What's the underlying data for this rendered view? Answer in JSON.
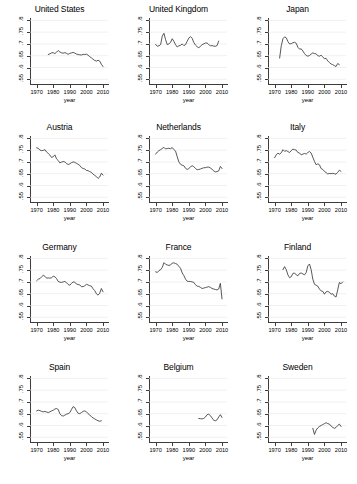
{
  "figure": {
    "layout": "4 rows x 3 columns small multiples",
    "background_color": "#ffffff",
    "line_color": "#3a3a3a",
    "gridline_color": "#e6e6e6",
    "axis_color": "#3c3c3c"
  },
  "axes": {
    "xlabel": "year",
    "ylabel": "",
    "xticks": [
      "1970",
      "1980",
      "1990",
      "2000",
      "2010"
    ],
    "xtick_values": [
      1970,
      1980,
      1990,
      2000,
      2010
    ],
    "yticks": [
      ".55",
      ".6",
      ".65",
      ".7",
      ".75",
      ".8"
    ],
    "ytick_values": [
      0.55,
      0.6,
      0.65,
      0.7,
      0.75,
      0.8
    ],
    "xlim": [
      1966,
      2013
    ],
    "ylim": [
      0.53,
      0.81
    ],
    "grid": "horizontal"
  },
  "chart_data": {
    "type": "line",
    "title": "",
    "xlabel": "year",
    "ylabel": "",
    "xlim": [
      1966,
      2013
    ],
    "ylim": [
      0.53,
      0.81
    ],
    "grid": true,
    "legend": "none",
    "panels": [
      {
        "title": "United States",
        "x": [
          1977,
          1978,
          1979,
          1980,
          1981,
          1982,
          1983,
          1984,
          1985,
          1986,
          1987,
          1988,
          1989,
          1990,
          1991,
          1992,
          1993,
          1994,
          1995,
          1996,
          1997,
          1998,
          1999,
          2000,
          2001,
          2002,
          2003,
          2004,
          2005,
          2006,
          2007,
          2008,
          2009,
          2010
        ],
        "values": [
          0.655,
          0.658,
          0.662,
          0.663,
          0.659,
          0.665,
          0.672,
          0.666,
          0.662,
          0.661,
          0.663,
          0.66,
          0.656,
          0.66,
          0.662,
          0.664,
          0.661,
          0.657,
          0.655,
          0.654,
          0.653,
          0.656,
          0.655,
          0.657,
          0.652,
          0.646,
          0.641,
          0.635,
          0.63,
          0.627,
          0.631,
          0.627,
          0.614,
          0.604
        ]
      },
      {
        "title": "United Kingdom",
        "x": [
          1970,
          1971,
          1972,
          1973,
          1974,
          1975,
          1976,
          1977,
          1978,
          1979,
          1980,
          1981,
          1982,
          1983,
          1984,
          1985,
          1986,
          1987,
          1988,
          1989,
          1990,
          1991,
          1992,
          1993,
          1994,
          1995,
          1996,
          1997,
          1998,
          1999,
          2000,
          2001,
          2002,
          2003,
          2004,
          2005,
          2006,
          2007,
          2008
        ],
        "values": [
          0.698,
          0.69,
          0.692,
          0.697,
          0.733,
          0.745,
          0.718,
          0.697,
          0.7,
          0.707,
          0.722,
          0.711,
          0.697,
          0.687,
          0.692,
          0.694,
          0.7,
          0.693,
          0.697,
          0.711,
          0.725,
          0.731,
          0.724,
          0.706,
          0.695,
          0.688,
          0.684,
          0.69,
          0.697,
          0.7,
          0.704,
          0.704,
          0.697,
          0.692,
          0.693,
          0.691,
          0.69,
          0.693,
          0.712
        ]
      },
      {
        "title": "Japan",
        "x": [
          1973,
          1974,
          1975,
          1976,
          1977,
          1978,
          1979,
          1980,
          1981,
          1982,
          1983,
          1984,
          1985,
          1986,
          1987,
          1988,
          1989,
          1990,
          1991,
          1992,
          1993,
          1994,
          1995,
          1996,
          1997,
          1998,
          1999,
          2000,
          2001,
          2002,
          2003,
          2004,
          2005,
          2006,
          2007,
          2008,
          2009
        ],
        "values": [
          0.64,
          0.692,
          0.722,
          0.73,
          0.726,
          0.71,
          0.7,
          0.701,
          0.705,
          0.707,
          0.703,
          0.686,
          0.678,
          0.679,
          0.67,
          0.659,
          0.651,
          0.648,
          0.651,
          0.657,
          0.662,
          0.659,
          0.658,
          0.65,
          0.648,
          0.652,
          0.645,
          0.637,
          0.639,
          0.628,
          0.621,
          0.615,
          0.612,
          0.608,
          0.604,
          0.617,
          0.612
        ]
      },
      {
        "title": "Austria",
        "x": [
          1970,
          1971,
          1972,
          1973,
          1974,
          1975,
          1976,
          1977,
          1978,
          1979,
          1980,
          1981,
          1982,
          1983,
          1984,
          1985,
          1986,
          1987,
          1988,
          1989,
          1990,
          1991,
          1992,
          1993,
          1994,
          1995,
          1996,
          1997,
          1998,
          1999,
          2000,
          2001,
          2002,
          2003,
          2004,
          2005,
          2006,
          2007,
          2008,
          2009,
          2010
        ],
        "values": [
          0.76,
          0.758,
          0.75,
          0.748,
          0.749,
          0.752,
          0.742,
          0.736,
          0.729,
          0.719,
          0.722,
          0.73,
          0.713,
          0.706,
          0.696,
          0.699,
          0.702,
          0.7,
          0.693,
          0.689,
          0.692,
          0.697,
          0.7,
          0.698,
          0.694,
          0.69,
          0.685,
          0.676,
          0.672,
          0.67,
          0.664,
          0.663,
          0.659,
          0.656,
          0.648,
          0.643,
          0.638,
          0.63,
          0.636,
          0.652,
          0.644
        ]
      },
      {
        "title": "Netherlands",
        "x": [
          1970,
          1971,
          1972,
          1973,
          1974,
          1975,
          1976,
          1977,
          1978,
          1979,
          1980,
          1981,
          1982,
          1983,
          1984,
          1985,
          1986,
          1987,
          1988,
          1989,
          1990,
          1991,
          1992,
          1993,
          1994,
          1995,
          1996,
          1997,
          1998,
          1999,
          2000,
          2001,
          2002,
          2003,
          2004,
          2005,
          2006,
          2007,
          2008,
          2009,
          2010
        ],
        "values": [
          0.733,
          0.742,
          0.748,
          0.752,
          0.757,
          0.762,
          0.755,
          0.757,
          0.758,
          0.756,
          0.761,
          0.752,
          0.746,
          0.722,
          0.7,
          0.69,
          0.686,
          0.684,
          0.673,
          0.668,
          0.672,
          0.679,
          0.684,
          0.68,
          0.672,
          0.667,
          0.668,
          0.67,
          0.673,
          0.675,
          0.676,
          0.678,
          0.678,
          0.674,
          0.669,
          0.662,
          0.658,
          0.659,
          0.662,
          0.681,
          0.672
        ]
      },
      {
        "title": "Italy",
        "x": [
          1970,
          1971,
          1972,
          1973,
          1974,
          1975,
          1976,
          1977,
          1978,
          1979,
          1980,
          1981,
          1982,
          1983,
          1984,
          1985,
          1986,
          1987,
          1988,
          1989,
          1990,
          1991,
          1992,
          1993,
          1994,
          1995,
          1996,
          1997,
          1998,
          1999,
          2000,
          2001,
          2002,
          2003,
          2004,
          2005,
          2006,
          2007,
          2008,
          2009,
          2010
        ],
        "values": [
          0.718,
          0.731,
          0.737,
          0.733,
          0.739,
          0.752,
          0.745,
          0.748,
          0.744,
          0.74,
          0.748,
          0.754,
          0.752,
          0.75,
          0.74,
          0.738,
          0.73,
          0.733,
          0.736,
          0.733,
          0.74,
          0.744,
          0.738,
          0.72,
          0.702,
          0.688,
          0.692,
          0.688,
          0.672,
          0.668,
          0.66,
          0.655,
          0.649,
          0.651,
          0.65,
          0.652,
          0.65,
          0.648,
          0.656,
          0.665,
          0.66
        ]
      },
      {
        "title": "Germany",
        "x": [
          1970,
          1971,
          1972,
          1973,
          1974,
          1975,
          1976,
          1977,
          1978,
          1979,
          1980,
          1981,
          1982,
          1983,
          1984,
          1985,
          1986,
          1987,
          1988,
          1989,
          1990,
          1991,
          1992,
          1993,
          1994,
          1995,
          1996,
          1997,
          1998,
          1999,
          2000,
          2001,
          2002,
          2003,
          2004,
          2005,
          2006,
          2007,
          2008,
          2009,
          2010
        ],
        "values": [
          0.705,
          0.712,
          0.714,
          0.722,
          0.728,
          0.724,
          0.716,
          0.717,
          0.716,
          0.718,
          0.724,
          0.722,
          0.714,
          0.702,
          0.699,
          0.698,
          0.7,
          0.702,
          0.697,
          0.689,
          0.686,
          0.694,
          0.7,
          0.699,
          0.691,
          0.689,
          0.687,
          0.68,
          0.68,
          0.684,
          0.69,
          0.687,
          0.684,
          0.682,
          0.671,
          0.663,
          0.65,
          0.644,
          0.652,
          0.672,
          0.658
        ]
      },
      {
        "title": "France",
        "x": [
          1970,
          1971,
          1972,
          1973,
          1974,
          1975,
          1976,
          1977,
          1978,
          1979,
          1980,
          1981,
          1982,
          1983,
          1984,
          1985,
          1986,
          1987,
          1988,
          1989,
          1990,
          1991,
          1992,
          1993,
          1994,
          1995,
          1996,
          1997,
          1998,
          1999,
          2000,
          2001,
          2002,
          2003,
          2004,
          2005,
          2006,
          2007,
          2008,
          2009,
          2010
        ],
        "values": [
          0.743,
          0.74,
          0.748,
          0.752,
          0.762,
          0.782,
          0.775,
          0.772,
          0.77,
          0.772,
          0.78,
          0.781,
          0.778,
          0.775,
          0.766,
          0.758,
          0.738,
          0.727,
          0.712,
          0.703,
          0.702,
          0.702,
          0.7,
          0.698,
          0.688,
          0.682,
          0.681,
          0.677,
          0.672,
          0.674,
          0.676,
          0.678,
          0.68,
          0.677,
          0.672,
          0.67,
          0.668,
          0.666,
          0.67,
          0.694,
          0.628
        ]
      },
      {
        "title": "Finland",
        "x": [
          1975,
          1976,
          1977,
          1978,
          1979,
          1980,
          1981,
          1982,
          1983,
          1984,
          1985,
          1986,
          1987,
          1988,
          1989,
          1990,
          1991,
          1992,
          1993,
          1994,
          1995,
          1996,
          1997,
          1998,
          1999,
          2000,
          2001,
          2002,
          2003,
          2004,
          2005,
          2006,
          2007,
          2008,
          2009,
          2010,
          2011
        ],
        "values": [
          0.752,
          0.765,
          0.752,
          0.73,
          0.718,
          0.722,
          0.736,
          0.738,
          0.73,
          0.726,
          0.736,
          0.738,
          0.734,
          0.73,
          0.74,
          0.768,
          0.776,
          0.752,
          0.712,
          0.69,
          0.686,
          0.682,
          0.67,
          0.662,
          0.66,
          0.648,
          0.658,
          0.66,
          0.656,
          0.648,
          0.65,
          0.64,
          0.636,
          0.666,
          0.698,
          0.692,
          0.7
        ]
      },
      {
        "title": "Spain",
        "x": [
          1970,
          1971,
          1972,
          1973,
          1974,
          1975,
          1976,
          1977,
          1978,
          1979,
          1980,
          1981,
          1982,
          1983,
          1984,
          1985,
          1986,
          1987,
          1988,
          1989,
          1990,
          1991,
          1992,
          1993,
          1994,
          1995,
          1996,
          1997,
          1998,
          1999,
          2000,
          2001,
          2002,
          2003,
          2004,
          2005,
          2006,
          2007,
          2008,
          2009
        ],
        "values": [
          0.662,
          0.665,
          0.663,
          0.66,
          0.658,
          0.66,
          0.657,
          0.655,
          0.658,
          0.662,
          0.665,
          0.67,
          0.672,
          0.668,
          0.65,
          0.642,
          0.64,
          0.644,
          0.648,
          0.65,
          0.655,
          0.668,
          0.68,
          0.676,
          0.662,
          0.652,
          0.65,
          0.655,
          0.66,
          0.662,
          0.658,
          0.65,
          0.644,
          0.638,
          0.632,
          0.628,
          0.624,
          0.62,
          0.618,
          0.62
        ]
      },
      {
        "title": "Belgium",
        "x": [
          1996,
          1997,
          1998,
          1999,
          2000,
          2001,
          2002,
          2003,
          2004,
          2005,
          2006,
          2007,
          2008,
          2009,
          2010
        ],
        "values": [
          0.63,
          0.629,
          0.628,
          0.63,
          0.636,
          0.646,
          0.648,
          0.642,
          0.632,
          0.622,
          0.62,
          0.624,
          0.636,
          0.646,
          0.634
        ]
      },
      {
        "title": "Sweden",
        "x": [
          1993,
          1994,
          1995,
          1996,
          1997,
          1998,
          1999,
          2000,
          2001,
          2002,
          2003,
          2004,
          2005,
          2006,
          2007,
          2008,
          2009,
          2010
        ],
        "values": [
          0.588,
          0.562,
          0.58,
          0.59,
          0.596,
          0.6,
          0.604,
          0.608,
          0.612,
          0.608,
          0.606,
          0.598,
          0.592,
          0.588,
          0.592,
          0.6,
          0.606,
          0.596
        ]
      }
    ]
  }
}
